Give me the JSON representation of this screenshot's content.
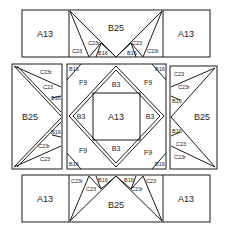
{
  "diagram": {
    "colors": {
      "line": "#1a1a1a",
      "text": "#222222",
      "background": "#ffffff"
    },
    "top_band": {
      "left_label": "A13",
      "center_label": "B25",
      "small_labels": [
        "C23",
        "C23r",
        "B16",
        "B16",
        "C23",
        "C23r"
      ]
    },
    "left_block": {
      "main_label": "B25",
      "small_labels": [
        "C23r",
        "C23",
        "B16",
        "B16",
        "C23r",
        "C23"
      ]
    },
    "center_block": {
      "center_label": "A13",
      "side_labels": [
        "B3",
        "B3",
        "B3",
        "B3"
      ],
      "corner_labels": [
        "F9",
        "F9",
        "F9",
        "F9"
      ],
      "tip_labels": [
        "B16",
        "B16",
        "B16",
        "B16"
      ]
    },
    "right_block": {
      "main_label": "B25",
      "small_labels": [
        "C23",
        "C23r",
        "B16",
        "B16",
        "C23",
        "C23r"
      ]
    },
    "bottom_band": {
      "left_label": "A13",
      "center_label": "B25",
      "right_label": "A13",
      "small_labels": [
        "C23r",
        "C23",
        "B16",
        "B16",
        "C23r",
        "C23"
      ]
    },
    "top_right_label": "A13"
  }
}
